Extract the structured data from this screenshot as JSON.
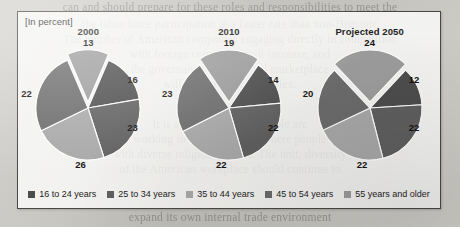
{
  "figure": {
    "units_label": "[In percent]"
  },
  "background_text": [
    "can and should prepare for these roles and responsibilities to meet the",
    "the labor force participation at a faster rate than non-Hispanic",
    "The number of American companies engaging directly in competition",
    "with foreign companies will increase, and",
    "the governance of the global marketplace",
    "will become more complex.",
    "It is a world in which people are",
    "working in the workplace, where people",
    "with diverse religious beliefs. The unit, diversity",
    "of the American workplace should continue to",
    "expand its own internal trade environment"
  ],
  "legend": {
    "items": [
      {
        "label": "16 to 24 years",
        "color": "#4d4d4d"
      },
      {
        "label": "25 to 34 years",
        "color": "#5f5f5f"
      },
      {
        "label": "35 to 44 years",
        "color": "#a8a8a8"
      },
      {
        "label": "45 to 54 years",
        "color": "#6b6b6b"
      },
      {
        "label": "55 years and older",
        "color": "#9c9c9c"
      }
    ]
  },
  "chart_data": {
    "type": "pie",
    "title": "",
    "units": "percent",
    "legend_position": "bottom",
    "categories": [
      "16 to 24 years",
      "25 to 34 years",
      "35 to 44 years",
      "45 to 54 years",
      "55 years and older"
    ],
    "colors": [
      "#4d4d4d",
      "#5f5f5f",
      "#a8a8a8",
      "#6b6b6b",
      "#9c9c9c"
    ],
    "charts": [
      {
        "title": "2000",
        "values": [
          16,
          23,
          23,
          26,
          13
        ],
        "exploded": "55 years and older",
        "labels": {
          "top": "13",
          "right_upper": "16",
          "right_lower": "23",
          "bottom": "26",
          "left": "22"
        }
      },
      {
        "title": "2010",
        "values": [
          14,
          22,
          22,
          23,
          19
        ],
        "exploded": "55 years and older",
        "labels": {
          "top": "19",
          "right_upper": "14",
          "right_lower": "22",
          "bottom": "22",
          "left": "23"
        }
      },
      {
        "title": "Projected 2050",
        "values": [
          12,
          22,
          22,
          20,
          24
        ],
        "exploded": "55 years and older",
        "labels": {
          "top": "24",
          "right_upper": "12",
          "right_lower": "22",
          "bottom": "22",
          "left": "20"
        }
      }
    ]
  }
}
